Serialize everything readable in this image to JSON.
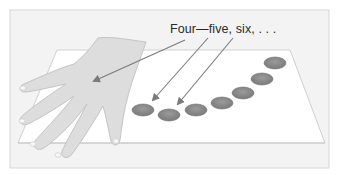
{
  "figure": {
    "caption": "Four—five, six, . . .",
    "elements": {
      "frame": "light-gray-bordered-panel",
      "table": "white-parallelogram-surface",
      "hand": "open-hand-resting-on-table",
      "counters": {
        "count": 7,
        "color": "#8a8a8a"
      },
      "arrows": {
        "count": 3,
        "color": "#7a7a7a",
        "targets": [
          "hand",
          "counter-1",
          "counter-2"
        ]
      }
    },
    "colors": {
      "background": "#f4f4f4",
      "table": "#ffffff",
      "hand": "#dcdcdc",
      "counter": "#8c8c8c",
      "text": "#2a2a2a"
    }
  }
}
